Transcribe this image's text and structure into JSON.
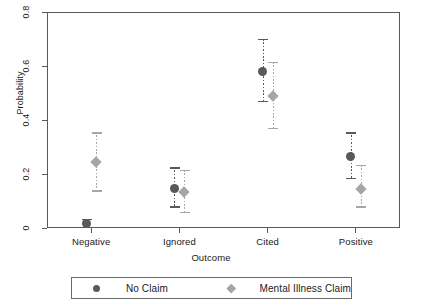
{
  "chart_data": {
    "type": "scatter",
    "title": "",
    "xlabel": "Outcome",
    "ylabel": "Probability",
    "categories": [
      "Negative",
      "Ignored",
      "Cited",
      "Positive"
    ],
    "ylim": [
      0,
      0.8
    ],
    "yticks": [
      0,
      0.2,
      0.4,
      0.6,
      0.8
    ],
    "ytick_labels": [
      "0",
      "0.2",
      "0.4",
      "0.6",
      "0.8"
    ],
    "grid": false,
    "legend_position": "bottom",
    "error_bars": "vertical with caps, dotted stems",
    "series": [
      {
        "name": "No Claim",
        "marker": "circle",
        "color": "#595959",
        "values": [
          0.015,
          0.145,
          0.58,
          0.265
        ],
        "ci_low": [
          0.0,
          0.075,
          0.465,
          0.18
        ],
        "ci_high": [
          0.035,
          0.225,
          0.7,
          0.355
        ]
      },
      {
        "name": "Mental Illness Claim",
        "marker": "diamond",
        "color": "#a6a6a6",
        "values": [
          0.245,
          0.135,
          0.49,
          0.145
        ],
        "ci_low": [
          0.135,
          0.055,
          0.365,
          0.075
        ],
        "ci_high": [
          0.355,
          0.215,
          0.615,
          0.235
        ]
      }
    ]
  },
  "legend": {
    "entries": [
      {
        "label": "No Claim"
      },
      {
        "label": "Mental Illness Claim"
      }
    ]
  }
}
